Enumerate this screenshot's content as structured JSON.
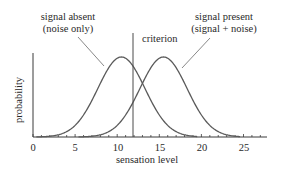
{
  "chart_data": {
    "type": "line",
    "title": "",
    "xlabel": "sensation level",
    "ylabel": "probability",
    "xlim": [
      0,
      28
    ],
    "x_ticks": [
      0,
      5,
      10,
      15,
      20,
      25
    ],
    "x_tick_labels": [
      "0",
      "5",
      "10",
      "15",
      "20",
      "25"
    ],
    "minor_tick_step": 1,
    "grid": false,
    "legend": "none (curves labelled with callouts)",
    "series": [
      {
        "name": "signal absent (noise only)",
        "distribution": "normal",
        "mean": 10.5,
        "sd": 2.8,
        "x": [
          2,
          4,
          6,
          8,
          10,
          10.5,
          12,
          14,
          16,
          18,
          19
        ],
        "relative_y": [
          0.01,
          0.07,
          0.27,
          0.67,
          0.98,
          1.0,
          0.87,
          0.46,
          0.15,
          0.03,
          0.01
        ]
      },
      {
        "name": "signal present (signal + noise)",
        "distribution": "normal",
        "mean": 15.5,
        "sd": 2.8,
        "x": [
          7,
          9,
          11,
          13,
          15,
          15.5,
          17,
          19,
          21,
          23,
          24
        ],
        "relative_y": [
          0.01,
          0.07,
          0.27,
          0.67,
          0.98,
          1.0,
          0.87,
          0.46,
          0.15,
          0.03,
          0.01
        ]
      }
    ],
    "annotations": [
      {
        "text": "criterion",
        "type": "vertical-line",
        "x": 12
      },
      {
        "text_lines": [
          "signal absent",
          "(noise only)"
        ],
        "points_to": "signal absent (noise only)"
      },
      {
        "text_lines": [
          "signal present",
          "(signal + noise)"
        ],
        "points_to": "signal present (signal + noise)"
      }
    ]
  },
  "labels": {
    "noise_line1": "signal absent",
    "noise_line2": "(noise only)",
    "signal_line1": "signal present",
    "signal_line2": "(signal + noise)",
    "criterion": "criterion",
    "xlabel": "sensation level",
    "ylabel": "probability",
    "ticks": [
      "0",
      "5",
      "10",
      "15",
      "20",
      "25"
    ]
  },
  "colors": {
    "curve": "#5a5a5a",
    "axis": "#3a3a3a",
    "text": "#2a2a2a"
  }
}
